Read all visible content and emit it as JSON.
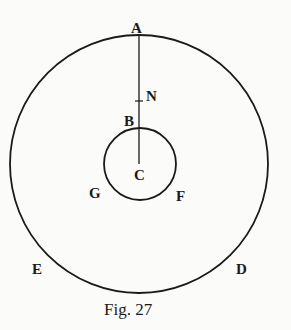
{
  "figure": {
    "caption": "Fig. 27",
    "outer_circle": {
      "cx": 139,
      "cy": 164,
      "r": 129
    },
    "inner_circle": {
      "cx": 140,
      "cy": 164,
      "r": 36
    },
    "radius_line": {
      "x": 139,
      "y1": 35,
      "y2": 164
    },
    "tick_N": {
      "y": 101
    },
    "labels": {
      "A": "A",
      "N": "N",
      "B": "B",
      "C": "C",
      "G": "G",
      "F": "F",
      "E": "E",
      "D": "D"
    },
    "stroke_color": "#1a1a1a",
    "background_color": "#fbfbfa"
  }
}
